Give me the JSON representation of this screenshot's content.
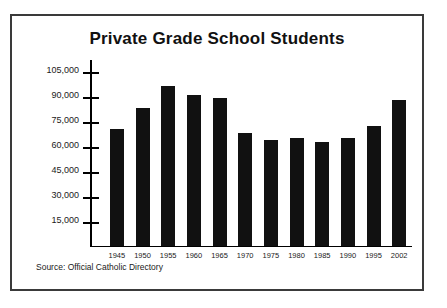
{
  "chart_data": {
    "type": "bar",
    "title": "Private Grade School Students",
    "xlabel": "",
    "ylabel": "",
    "categories": [
      "1945",
      "1950",
      "1955",
      "1960",
      "1965",
      "1970",
      "1975",
      "1980",
      "1985",
      "1990",
      "1995",
      "2002"
    ],
    "values": [
      70000,
      82500,
      96000,
      90500,
      89000,
      67500,
      63500,
      64500,
      62000,
      64500,
      72000,
      87500
    ],
    "ylim": [
      0,
      112500
    ],
    "ytick_values": [
      15000,
      30000,
      45000,
      60000,
      75000,
      90000,
      105000
    ],
    "ytick_labels": [
      "15,000",
      "30,000",
      "45,000",
      "60,000",
      "75,000",
      "90,000",
      "105,000"
    ],
    "grid": false,
    "legend": null,
    "bar_color": "#111111",
    "source": "Source: Official Catholic Directory"
  },
  "frame": {
    "border_color": "#3a3a3a",
    "background": "#ffffff"
  }
}
